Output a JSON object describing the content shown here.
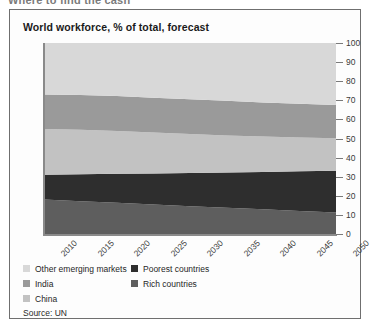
{
  "headline": "Where to find the cash",
  "card": {
    "chart_title": "World workforce, % of total, forecast",
    "source": "Source: UN"
  },
  "legend": {
    "left_column": [
      {
        "label": "Other emerging markets",
        "color": "#d8d8d8"
      },
      {
        "label": "India",
        "color": "#9a9a9a"
      },
      {
        "label": "China",
        "color": "#c2c2c2"
      }
    ],
    "right_column": [
      {
        "label": "Poorest countries",
        "color": "#2e2e2e"
      },
      {
        "label": "Rich countries",
        "color": "#5e5e5e"
      }
    ]
  },
  "chart_data": {
    "type": "area",
    "stacked": true,
    "title": "World workforce, % of total, forecast",
    "subtitle": "",
    "xlabel": "",
    "ylabel": "",
    "source": "Source: UN",
    "grid": false,
    "legend_position": "bottom",
    "x": [
      2010,
      2015,
      2020,
      2025,
      2030,
      2035,
      2040,
      2045,
      2050
    ],
    "xlim": [
      2010,
      2050
    ],
    "xticks": [
      2010,
      2015,
      2020,
      2025,
      2030,
      2035,
      2040,
      2045,
      2050
    ],
    "xtick_labels": [
      "2010",
      "2015",
      "2020",
      "2025",
      "2030",
      "2035",
      "2040",
      "2045",
      "2050"
    ],
    "xtick_rotation": -45,
    "ylim": [
      0,
      100
    ],
    "yticks": [
      0,
      10,
      20,
      30,
      40,
      50,
      60,
      70,
      80,
      90,
      100
    ],
    "ytick_labels": [
      "0",
      "10",
      "20",
      "30",
      "40",
      "50",
      "60",
      "70",
      "80",
      "90",
      "100"
    ],
    "y_axis_side": "right",
    "stack_order_bottom_to_top": [
      "Rich countries",
      "Poorest countries",
      "China",
      "India",
      "Other emerging markets"
    ],
    "series": [
      {
        "name": "Rich countries",
        "color": "#5e5e5e",
        "values": [
          18,
          17.2,
          16.3,
          15.4,
          14.5,
          13.7,
          12.9,
          12.1,
          11.3
        ]
      },
      {
        "name": "Poorest countries",
        "color": "#2e2e2e",
        "values": [
          13,
          14.1,
          15.2,
          16.3,
          17.4,
          18.5,
          19.6,
          20.7,
          21.8
        ]
      },
      {
        "name": "China",
        "color": "#c2c2c2",
        "values": [
          24,
          23.3,
          22.4,
          21.4,
          20.4,
          19.4,
          18.5,
          17.7,
          17
        ]
      },
      {
        "name": "India",
        "color": "#9a9a9a",
        "values": [
          18,
          18.2,
          18.3,
          18.3,
          18.2,
          18.1,
          17.9,
          17.7,
          17.5
        ]
      },
      {
        "name": "Other emerging markets",
        "color": "#d8d8d8",
        "values": [
          27,
          27.2,
          27.8,
          28.6,
          29.5,
          30.3,
          31.1,
          31.8,
          32.4
        ]
      }
    ]
  }
}
